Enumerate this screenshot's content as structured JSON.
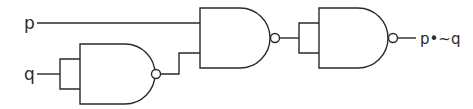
{
  "diagram": {
    "type": "logic-circuit",
    "inputs": [
      {
        "id": "p",
        "label": "p"
      },
      {
        "id": "q",
        "label": "q"
      }
    ],
    "gates": [
      {
        "id": "g1",
        "type": "NAND",
        "inputs": [
          "q",
          "q"
        ],
        "output": "~q"
      },
      {
        "id": "g2",
        "type": "NAND",
        "inputs": [
          "p",
          "~q"
        ],
        "output": "~(p•~q)"
      },
      {
        "id": "g3",
        "type": "NAND",
        "inputs": [
          "g2",
          "g2"
        ],
        "output": "p•~q"
      }
    ],
    "output": {
      "label": "p•~q"
    },
    "colors": {
      "stroke": "#2a2a2a",
      "background": "#ffffff"
    }
  }
}
